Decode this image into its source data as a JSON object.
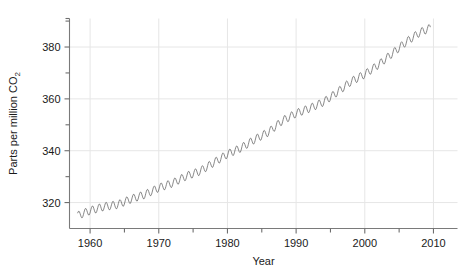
{
  "chart_data": {
    "type": "line",
    "title": "",
    "subtitle": "",
    "xlabel": "Year",
    "ylabel": "Parts per million CO2",
    "ylabel_base": "Parts per million CO",
    "ylabel_sub": "2",
    "xlim": [
      1957.0,
      2013.5
    ],
    "ylim": [
      310.0,
      391.0
    ],
    "xticks": [
      1960,
      1970,
      1980,
      1990,
      2000,
      2010
    ],
    "xtick_labels": [
      "1960",
      "1970",
      "1980",
      "1990",
      "2000",
      "2010"
    ],
    "xminor_ticks": [
      1965,
      1975,
      1985,
      1995,
      2005
    ],
    "yticks": [
      320,
      340,
      360,
      380
    ],
    "ytick_labels": [
      "320",
      "340",
      "360",
      "380"
    ],
    "yminor_ticks": [
      330,
      350,
      370,
      390
    ],
    "grid": true,
    "grid_color": "#e6e6e6",
    "line_color": "#555555",
    "line_width": 0.7,
    "legend": null,
    "annotations": [],
    "series": [
      {
        "name": "Atmospheric CO2 (Mauna Loa)",
        "description": "Monthly mean CO2 concentration with seasonal cycle",
        "x_start": 1958.2,
        "x_end": 2009.6,
        "trend_points": [
          {
            "year": 1958.2,
            "ppm": 315.0
          },
          {
            "year": 1960.0,
            "ppm": 316.9
          },
          {
            "year": 1962.0,
            "ppm": 318.4
          },
          {
            "year": 1964.0,
            "ppm": 319.2
          },
          {
            "year": 1966.0,
            "ppm": 321.4
          },
          {
            "year": 1968.0,
            "ppm": 323.1
          },
          {
            "year": 1970.0,
            "ppm": 325.7
          },
          {
            "year": 1972.0,
            "ppm": 327.5
          },
          {
            "year": 1974.0,
            "ppm": 330.2
          },
          {
            "year": 1976.0,
            "ppm": 332.1
          },
          {
            "year": 1978.0,
            "ppm": 335.4
          },
          {
            "year": 1980.0,
            "ppm": 338.7
          },
          {
            "year": 1982.0,
            "ppm": 341.1
          },
          {
            "year": 1984.0,
            "ppm": 344.4
          },
          {
            "year": 1986.0,
            "ppm": 347.2
          },
          {
            "year": 1988.0,
            "ppm": 351.6
          },
          {
            "year": 1990.0,
            "ppm": 354.4
          },
          {
            "year": 1992.0,
            "ppm": 356.4
          },
          {
            "year": 1994.0,
            "ppm": 358.8
          },
          {
            "year": 1996.0,
            "ppm": 362.6
          },
          {
            "year": 1998.0,
            "ppm": 366.7
          },
          {
            "year": 2000.0,
            "ppm": 369.5
          },
          {
            "year": 2002.0,
            "ppm": 373.2
          },
          {
            "year": 2004.0,
            "ppm": 377.5
          },
          {
            "year": 2006.0,
            "ppm": 381.9
          },
          {
            "year": 2008.0,
            "ppm": 385.6
          },
          {
            "year": 2009.6,
            "ppm": 387.4
          }
        ],
        "seasonal_amplitude_ppm": 3.1,
        "seasonal_peak_month": 5,
        "samples_per_year": 12
      }
    ]
  }
}
